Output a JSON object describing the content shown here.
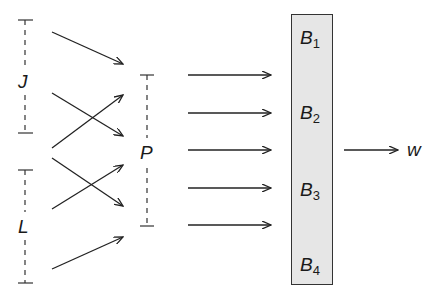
{
  "diagram": {
    "groups": [
      {
        "id": "J",
        "label": "J"
      },
      {
        "id": "L",
        "label": "L"
      },
      {
        "id": "P",
        "label": "P"
      }
    ],
    "box": {
      "fill": "#e6e6e6",
      "items": [
        {
          "base": "B",
          "sub": "1"
        },
        {
          "base": "B",
          "sub": "2"
        },
        {
          "base": "B",
          "sub": "3"
        },
        {
          "base": "B",
          "sub": "4"
        }
      ]
    },
    "output": {
      "label": "w"
    },
    "edges": [
      {
        "from": "J",
        "to": "P",
        "count": 3
      },
      {
        "from": "L",
        "to": "P",
        "count": 3
      },
      {
        "from": "P",
        "to": "B",
        "count": 5
      },
      {
        "from": "B",
        "to": "w",
        "count": 1
      }
    ]
  }
}
